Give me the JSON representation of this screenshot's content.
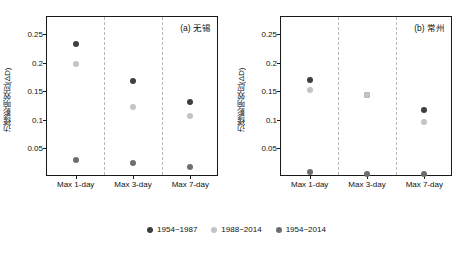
{
  "chart_data": {
    "type": "scatter",
    "title": "",
    "panels": [
      {
        "label": "(a) 无锡",
        "xlabel": "",
        "ylabel": "边缘影响效应(ΔD)",
        "categories": [
          "Max 1-day",
          "Max 3-day",
          "Max 7-day"
        ],
        "ylim": [
          0,
          0.28
        ],
        "yticks": [
          0.05,
          0.1,
          0.15,
          0.2,
          0.25
        ],
        "ytick_labels": [
          "0.05",
          "0.1",
          "0.15",
          "0.2",
          "0.25"
        ],
        "series": [
          {
            "name": "1954–1987",
            "color": "#3f3f3f",
            "values": [
              0.232,
              0.168,
              0.132
            ]
          },
          {
            "name": "1988–2014",
            "color": "#c4c4c4",
            "values": [
              0.198,
              0.123,
              0.107
            ]
          },
          {
            "name": "1954–2014",
            "color": "#6e6e6e",
            "values": [
              0.029,
              0.024,
              0.018
            ]
          }
        ]
      },
      {
        "label": "(b) 常州",
        "xlabel": "",
        "ylabel": "边缘影响效应(ΔD)",
        "categories": [
          "Max 1-day",
          "Max 3-day",
          "Max 7-day"
        ],
        "ylim": [
          0,
          0.28
        ],
        "yticks": [
          0.05,
          0.1,
          0.15,
          0.2,
          0.25
        ],
        "ytick_labels": [
          "0.05",
          "0.1",
          "0.15",
          "0.2",
          "0.25"
        ],
        "series": [
          {
            "name": "1954–1987",
            "color": "#3f3f3f",
            "values": [
              0.17,
              0.144,
              0.118
            ]
          },
          {
            "name": "1988–2014",
            "color": "#c4c4c4",
            "values": [
              0.152,
              0.144,
              0.096
            ]
          },
          {
            "name": "1954–2014",
            "color": "#6e6e6e",
            "values": [
              0.008,
              0.006,
              0.006
            ]
          }
        ]
      }
    ],
    "legend": {
      "position": "bottom-center",
      "entries": [
        {
          "label": "1954~1987",
          "color": "#3f3f3f"
        },
        {
          "label": "1988~2014",
          "color": "#c4c4c4"
        },
        {
          "label": "1954~2014",
          "color": "#6e6e6e"
        }
      ]
    },
    "grid": "vertical-dashed-separators"
  }
}
